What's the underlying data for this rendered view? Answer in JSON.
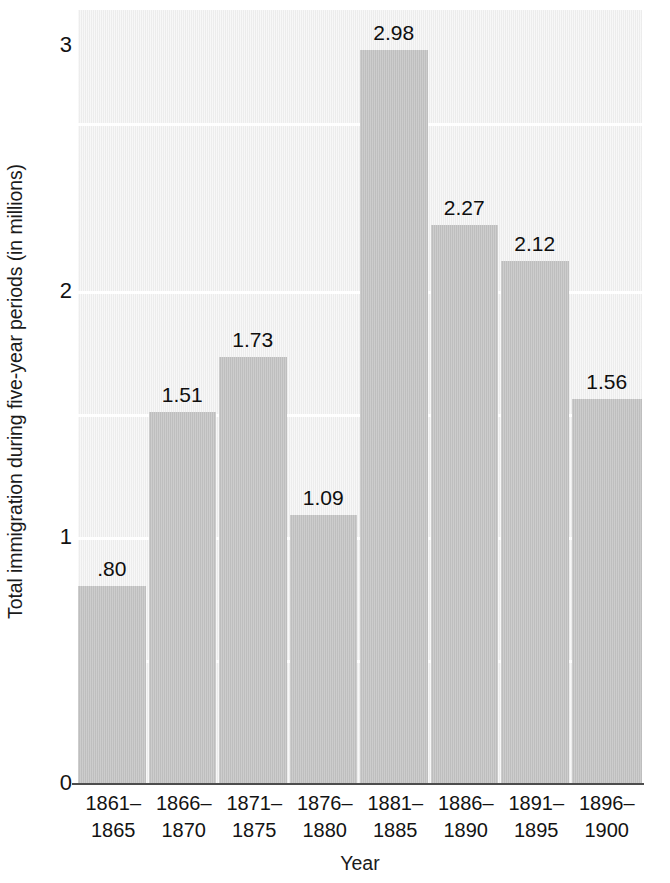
{
  "chart_data": {
    "type": "bar",
    "title": "",
    "xlabel": "Year",
    "ylabel": "Total immigration during five-year periods (in millions)",
    "categories": [
      "1861–1865",
      "1866–1870",
      "1871–1875",
      "1876–1880",
      "1881–1885",
      "1886–1890",
      "1891–1895",
      "1896–1900"
    ],
    "category_lines": [
      [
        "1861–",
        "1865"
      ],
      [
        "1866–",
        "1870"
      ],
      [
        "1871–",
        "1875"
      ],
      [
        "1876–",
        "1880"
      ],
      [
        "1881–",
        "1885"
      ],
      [
        "1886–",
        "1890"
      ],
      [
        "1891–",
        "1895"
      ],
      [
        "1896–",
        "1900"
      ]
    ],
    "values": [
      0.8,
      1.51,
      1.73,
      1.09,
      2.98,
      2.27,
      2.12,
      1.56
    ],
    "value_labels": [
      ".80",
      "1.51",
      "1.73",
      "1.09",
      "2.98",
      "2.27",
      "2.12",
      "1.56"
    ],
    "ylim": [
      0,
      3
    ],
    "yticks": [
      0,
      1,
      2,
      3
    ],
    "ytick_labels": [
      "0",
      "1",
      "2",
      "3"
    ],
    "minor_gridlines": [
      0.5,
      1.5,
      2.5
    ],
    "grid": "horizontal-white-on-gray",
    "legend": "none",
    "bar_color": "#c2c2c2",
    "plot_background": "#efefef",
    "axis_color": "#4d4d4d",
    "text_color": "#131313"
  }
}
